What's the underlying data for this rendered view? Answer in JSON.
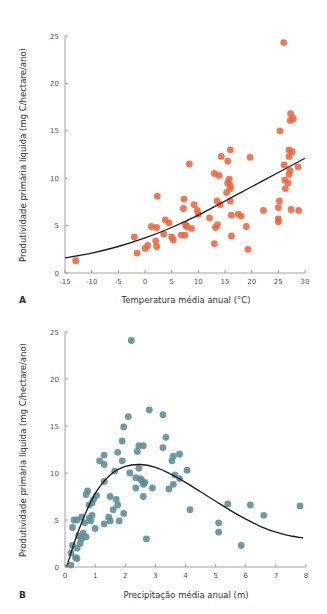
{
  "chart_data": [
    {
      "type": "scatter",
      "panel": "A",
      "title": "",
      "xlabel": "Temperatura média anual (°C)",
      "ylabel": "Produtividade primária líquida (mg C/hectare/ano)",
      "xlim": [
        -15,
        30
      ],
      "ylim": [
        0,
        25
      ],
      "xticks": [
        -15,
        -10,
        -5,
        0,
        5,
        10,
        15,
        20,
        25,
        30
      ],
      "yticks": [
        0,
        5,
        10,
        15,
        20,
        25
      ],
      "grid": false,
      "color": "#f0643a",
      "trend": {
        "type": "curve",
        "x": [
          -15,
          -10,
          -5,
          0,
          5,
          10,
          15,
          20,
          25,
          30
        ],
        "y": [
          1.6,
          2.1,
          2.8,
          3.7,
          4.8,
          6.1,
          7.6,
          9.1,
          10.6,
          12.1
        ]
      },
      "points": [
        [
          -13,
          1.3
        ],
        [
          -2,
          3.8
        ],
        [
          -1.5,
          2.1
        ],
        [
          0,
          2.6
        ],
        [
          0.5,
          2.9
        ],
        [
          1.2,
          4.9
        ],
        [
          2,
          3.4
        ],
        [
          2.2,
          2.8
        ],
        [
          2.3,
          8.1
        ],
        [
          2.2,
          4.8
        ],
        [
          3.5,
          4.1
        ],
        [
          3.8,
          5.6
        ],
        [
          4.5,
          5.3
        ],
        [
          5,
          3.8
        ],
        [
          5.3,
          3.5
        ],
        [
          6.8,
          4.0
        ],
        [
          7.2,
          6.8
        ],
        [
          7.3,
          7.8
        ],
        [
          7.6,
          5.1
        ],
        [
          7.5,
          4.0
        ],
        [
          7.8,
          4.9
        ],
        [
          8.3,
          11.5
        ],
        [
          8.7,
          4.7
        ],
        [
          9.2,
          7.2
        ],
        [
          9.8,
          6.6
        ],
        [
          10,
          6.2
        ],
        [
          12.1,
          5.8
        ],
        [
          13,
          3.1
        ],
        [
          13,
          10.5
        ],
        [
          13.2,
          4.8
        ],
        [
          13.5,
          7.6
        ],
        [
          13.6,
          5.1
        ],
        [
          13.9,
          10.3
        ],
        [
          14.1,
          7.2
        ],
        [
          14.3,
          12.3
        ],
        [
          15.3,
          8.5
        ],
        [
          15.5,
          11.8
        ],
        [
          15.5,
          9.5
        ],
        [
          15.8,
          9.9
        ],
        [
          16,
          9.2
        ],
        [
          16,
          8.9
        ],
        [
          16,
          13.0
        ],
        [
          16,
          7.6
        ],
        [
          16.2,
          6.1
        ],
        [
          16.2,
          3.9
        ],
        [
          17.5,
          6.2
        ],
        [
          18,
          6.0
        ],
        [
          19,
          4.9
        ],
        [
          19.3,
          2.5
        ],
        [
          19.7,
          12.2
        ],
        [
          22.2,
          6.6
        ],
        [
          25,
          5.4
        ],
        [
          25,
          5.7
        ],
        [
          25,
          6.9
        ],
        [
          25.2,
          7.6
        ],
        [
          25.3,
          15.0
        ],
        [
          26,
          24.3
        ],
        [
          26.1,
          11.4
        ],
        [
          26.2,
          9.8
        ],
        [
          26.3,
          8.9
        ],
        [
          26.8,
          9.5
        ],
        [
          27,
          13.0
        ],
        [
          27,
          12.3
        ],
        [
          27,
          10.4
        ],
        [
          27.2,
          10.8
        ],
        [
          27.2,
          16.1
        ],
        [
          27.3,
          16.8
        ],
        [
          27.4,
          6.7
        ],
        [
          27.6,
          12.8
        ],
        [
          27.8,
          16.3
        ],
        [
          28.7,
          11.2
        ],
        [
          28.8,
          6.6
        ]
      ]
    },
    {
      "type": "scatter",
      "panel": "B",
      "title": "",
      "xlabel": "Precipitação média anual (m)",
      "ylabel": "Produtividade primária líquida (mg C/hectare/ano)",
      "xlim": [
        0,
        8
      ],
      "ylim": [
        0,
        25
      ],
      "xticks": [
        0,
        1,
        2,
        3,
        4,
        5,
        6,
        7,
        8
      ],
      "yticks": [
        0,
        5,
        10,
        15,
        20,
        25
      ],
      "grid": false,
      "color": "#5b8c95",
      "trend": {
        "type": "curve",
        "x": [
          0.05,
          0.5,
          1,
          1.5,
          2,
          2.5,
          3,
          3.5,
          4,
          4.5,
          5,
          5.5,
          6,
          6.5,
          7,
          7.5,
          7.9
        ],
        "y": [
          0,
          4.3,
          7.8,
          9.8,
          10.7,
          10.9,
          10.6,
          9.9,
          9.0,
          8.0,
          7.0,
          6.0,
          5.1,
          4.3,
          3.7,
          3.3,
          3.1
        ]
      },
      "points": [
        [
          0.2,
          0.2
        ],
        [
          0.25,
          4.2
        ],
        [
          0.3,
          5.0
        ],
        [
          0.2,
          1.5
        ],
        [
          0.25,
          2.3
        ],
        [
          0.35,
          1.0
        ],
        [
          0.4,
          2.0
        ],
        [
          0.4,
          0.9
        ],
        [
          0.45,
          3.3
        ],
        [
          0.4,
          5.0
        ],
        [
          0.5,
          2.5
        ],
        [
          0.55,
          3.0
        ],
        [
          0.6,
          3.6
        ],
        [
          0.55,
          5.3
        ],
        [
          0.65,
          4.7
        ],
        [
          0.7,
          7.7
        ],
        [
          0.7,
          3.2
        ],
        [
          0.75,
          8.1
        ],
        [
          0.8,
          6.6
        ],
        [
          0.8,
          5.2
        ],
        [
          0.85,
          4.9
        ],
        [
          0.9,
          5.5
        ],
        [
          0.9,
          6.8
        ],
        [
          0.95,
          7.2
        ],
        [
          1.0,
          4.1
        ],
        [
          1.05,
          7.6
        ],
        [
          1.15,
          11.3
        ],
        [
          1.3,
          11.9
        ],
        [
          1.3,
          10.9
        ],
        [
          1.3,
          9.1
        ],
        [
          1.3,
          4.6
        ],
        [
          1.45,
          5.3
        ],
        [
          1.5,
          4.9
        ],
        [
          1.5,
          7.5
        ],
        [
          1.6,
          6.1
        ],
        [
          1.65,
          10.2
        ],
        [
          1.7,
          7.2
        ],
        [
          1.75,
          12.2
        ],
        [
          1.75,
          6.6
        ],
        [
          1.8,
          4.9
        ],
        [
          1.9,
          13.4
        ],
        [
          1.9,
          11.3
        ],
        [
          1.95,
          14.9
        ],
        [
          1.95,
          5.7
        ],
        [
          2.1,
          16.0
        ],
        [
          2.15,
          10.0
        ],
        [
          2.2,
          24.1
        ],
        [
          2.35,
          9.5
        ],
        [
          2.35,
          8.4
        ],
        [
          2.4,
          12.3
        ],
        [
          2.45,
          12.9
        ],
        [
          2.45,
          10.5
        ],
        [
          2.5,
          9.4
        ],
        [
          2.55,
          9.2
        ],
        [
          2.6,
          12.9
        ],
        [
          2.6,
          8.8
        ],
        [
          2.6,
          7.5
        ],
        [
          2.65,
          9.0
        ],
        [
          2.7,
          3.0
        ],
        [
          2.8,
          16.7
        ],
        [
          2.9,
          8.4
        ],
        [
          3.25,
          16.2
        ],
        [
          3.25,
          12.7
        ],
        [
          3.35,
          13.8
        ],
        [
          3.45,
          8.3
        ],
        [
          3.55,
          11.3
        ],
        [
          3.6,
          11.8
        ],
        [
          3.6,
          8.8
        ],
        [
          3.65,
          9.8
        ],
        [
          3.8,
          12.0
        ],
        [
          3.8,
          9.4
        ],
        [
          4.05,
          10.3
        ],
        [
          4.15,
          6.1
        ],
        [
          5.1,
          4.7
        ],
        [
          5.1,
          3.7
        ],
        [
          5.4,
          6.7
        ],
        [
          5.85,
          2.3
        ],
        [
          6.15,
          6.6
        ],
        [
          6.6,
          5.5
        ],
        [
          7.8,
          6.5
        ]
      ]
    }
  ],
  "panels": {
    "a": {
      "label": "A",
      "xlabel": "Temperatura média anual (°C)",
      "ylabel": "Produtividade primária líquida (mg C/hectare/ano)"
    },
    "b": {
      "label": "B",
      "xlabel": "Precipitação média anual (m)",
      "ylabel": "Produtividade primária líquida (mg C/hectare/ano)"
    }
  }
}
